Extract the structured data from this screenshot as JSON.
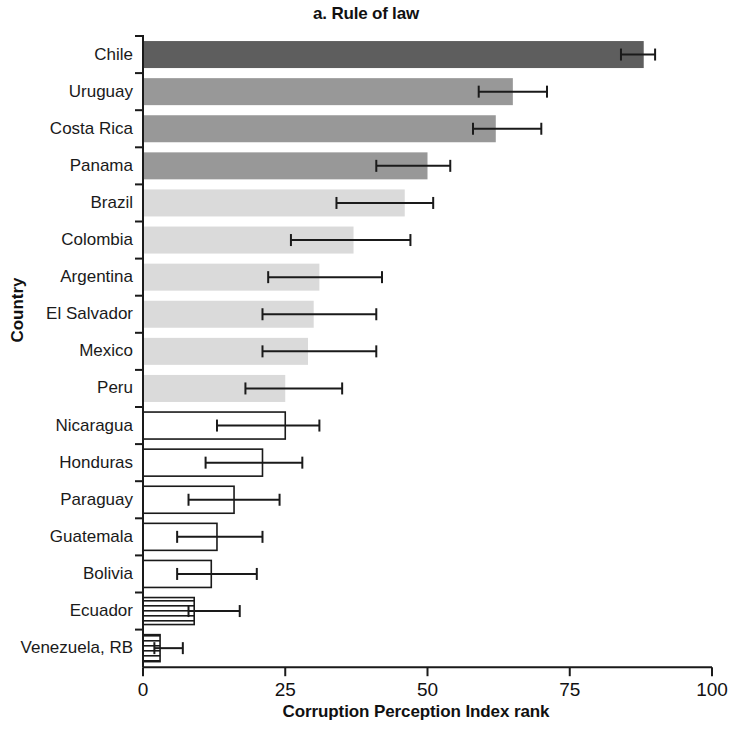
{
  "chart_data": {
    "type": "bar",
    "orientation": "horizontal",
    "title": "a. Rule of law",
    "xlabel": "Corruption Perception Index rank",
    "ylabel": "Country",
    "xlim": [
      0,
      100
    ],
    "xticks": [
      0,
      25,
      50,
      75,
      100
    ],
    "xtick_labels": [
      "0",
      "25",
      "50",
      "75",
      "100"
    ],
    "grid": false,
    "legend": null,
    "categories": [
      "Chile",
      "Uruguay",
      "Costa Rica",
      "Panama",
      "Brazil",
      "Colombia",
      "Argentina",
      "El Salvador",
      "Mexico",
      "Peru",
      "Nicaragua",
      "Honduras",
      "Paraguay",
      "Guatemala",
      "Bolivia",
      "Ecuador",
      "Venezuela, RB"
    ],
    "values": [
      88,
      65,
      62,
      50,
      46,
      37,
      31,
      30,
      29,
      25,
      25,
      21,
      16,
      13,
      12,
      9,
      3
    ],
    "error_low": [
      84,
      59,
      58,
      41,
      34,
      26,
      22,
      21,
      21,
      18,
      13,
      11,
      8,
      6,
      6,
      8,
      2
    ],
    "error_high": [
      90,
      71,
      70,
      54,
      51,
      47,
      42,
      41,
      41,
      35,
      31,
      28,
      24,
      21,
      20,
      17,
      7
    ],
    "styles": [
      "dark-gray",
      "medium-gray",
      "medium-gray",
      "medium-gray",
      "light-gray",
      "light-gray",
      "light-gray",
      "light-gray",
      "light-gray",
      "light-gray",
      "white-outline",
      "white-outline",
      "white-outline",
      "white-outline",
      "white-outline",
      "hatched",
      "hatched"
    ]
  },
  "colors": {
    "dark_gray": "#5e5e5e",
    "medium_gray": "#989898",
    "light_gray": "#dadada",
    "outline": "#1a1a1a",
    "axis": "#1a1a1a",
    "text": "#111111"
  }
}
